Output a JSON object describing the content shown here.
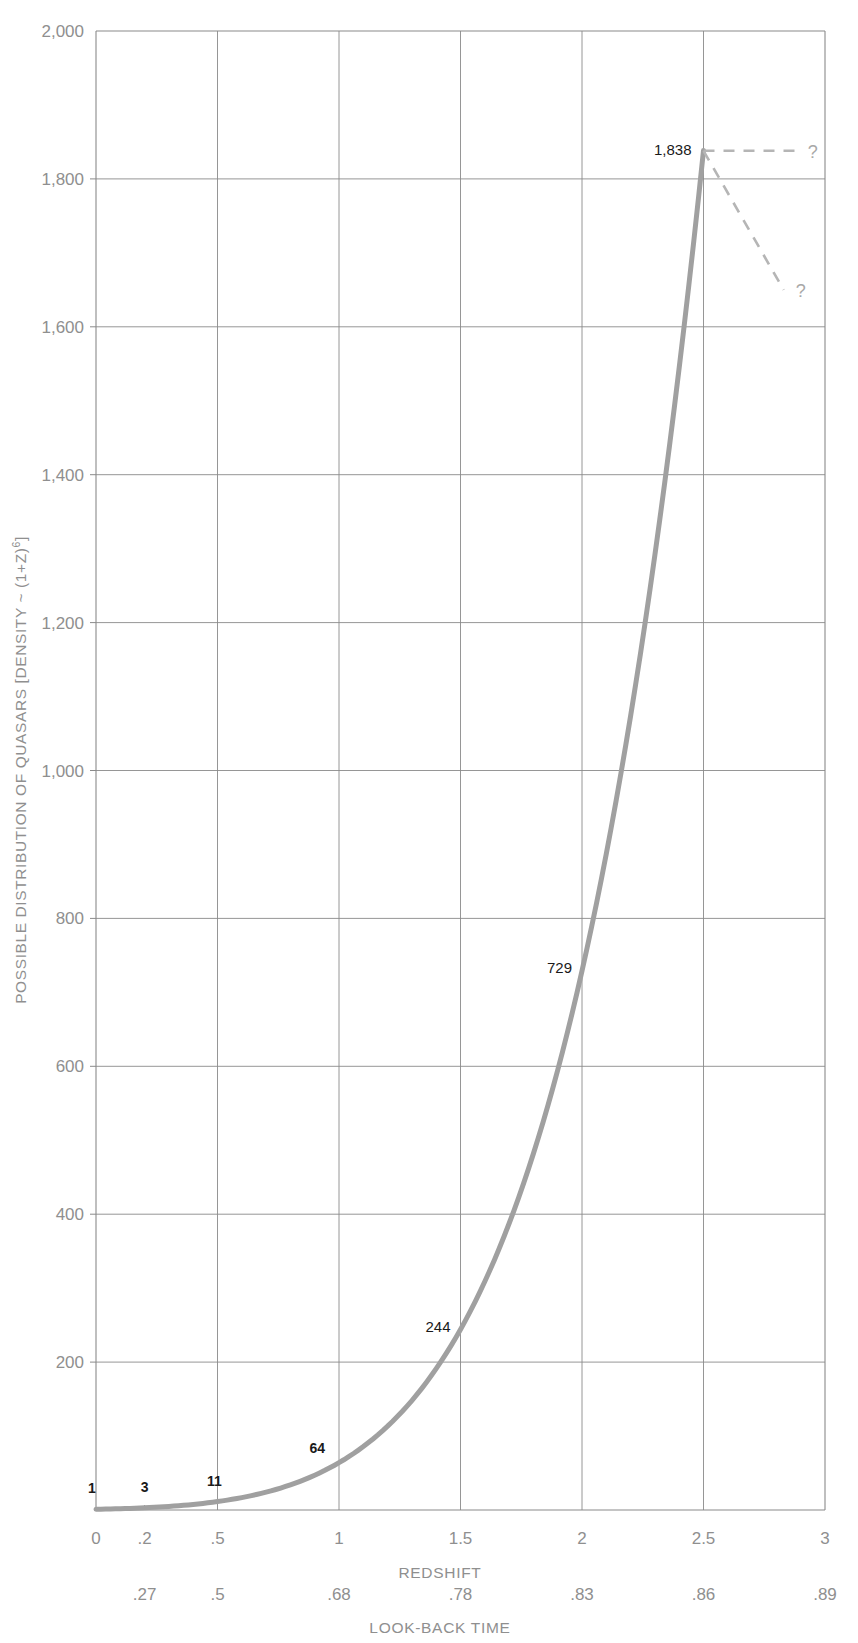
{
  "chart_data": {
    "type": "line",
    "title": "",
    "ylabel": "POSSIBLE DISTRIBUTION OF QUASARS [DENSITY ~ (1+Z)⁶]",
    "ylabel_parts": {
      "main": "POSSIBLE DISTRIBUTION OF QUASARS [DENSITY ~ (1+Z)",
      "exponent": "6",
      "tail": "]"
    },
    "xlabel": "REDSHIFT",
    "xlabel_secondary": "LOOK-BACK TIME",
    "ylim": [
      0,
      2000
    ],
    "xlim": [
      0,
      3
    ],
    "grid": true,
    "legend": false,
    "y_ticks": [
      0,
      200,
      400,
      600,
      800,
      1000,
      1200,
      1400,
      1600,
      1800,
      2000
    ],
    "y_tick_labels": [
      "",
      "200",
      "400",
      "600",
      "800",
      "1,000",
      "1,200",
      "1,400",
      "1,600",
      "1,800",
      "2,000"
    ],
    "x_ticks": [
      0,
      0.2,
      0.5,
      1,
      1.5,
      2,
      2.5,
      3
    ],
    "x_tick_labels": [
      "0",
      ".2",
      ".5",
      "1",
      "1.5",
      "2",
      "2.5",
      "3"
    ],
    "x_gridlines": [
      0.5,
      1,
      1.5,
      2,
      2.5
    ],
    "lookback_ticks": [
      0.2,
      0.5,
      1,
      1.5,
      2,
      2.5,
      3
    ],
    "lookback_tick_labels": [
      ".27",
      ".5",
      ".68",
      ".78",
      ".83",
      ".86",
      ".89"
    ],
    "series": [
      {
        "name": "density",
        "color": "#a0a0a0",
        "x": [
          0,
          0.2,
          0.5,
          1,
          1.5,
          2,
          2.5
        ],
        "values": [
          1,
          3,
          11,
          64,
          244,
          729,
          1838
        ]
      }
    ],
    "point_labels": [
      {
        "x": 0,
        "y": 1,
        "text": "1"
      },
      {
        "x": 0.2,
        "y": 3,
        "text": "3"
      },
      {
        "x": 0.5,
        "y": 11,
        "text": "11"
      },
      {
        "x": 1,
        "y": 64,
        "text": "64"
      },
      {
        "x": 1.5,
        "y": 244,
        "text": "244"
      },
      {
        "x": 2,
        "y": 729,
        "text": "729"
      },
      {
        "x": 2.5,
        "y": 1838,
        "text": "1,838"
      }
    ],
    "projections": [
      {
        "name": "flat-projection",
        "from_x": 2.5,
        "from_y": 1838,
        "to_x": 2.88,
        "to_y": 1838,
        "label": "?"
      },
      {
        "name": "declining-projection",
        "from_x": 2.5,
        "from_y": 1838,
        "to_x": 2.83,
        "to_y": 1650,
        "label": "?"
      }
    ],
    "projection_color": "#b5b5b5",
    "axis_color": "#8a8a8a",
    "grid_color": "#8a8a8a"
  }
}
